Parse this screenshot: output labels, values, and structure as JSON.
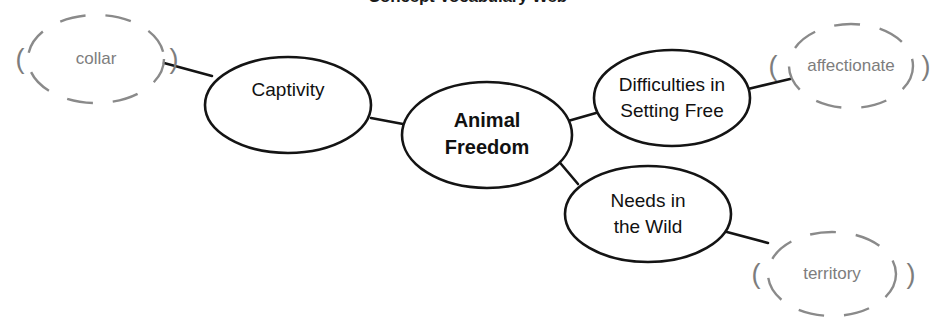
{
  "diagram": {
    "title": "Concept Vocabulary Web",
    "type": "concept-web",
    "colors": {
      "node_stroke": "#141414",
      "node_fill": "#ffffff",
      "vocab_stroke": "#8a8a8a",
      "vocab_text": "#7d7d7d",
      "node_text": "#111111",
      "background": "#ffffff"
    },
    "center_node": {
      "id": "animal-freedom",
      "lines": [
        "Animal",
        "Freedom"
      ],
      "bold": true,
      "cx": 487,
      "cy": 135,
      "rx": 85,
      "ry": 53
    },
    "branch_nodes": [
      {
        "id": "captivity",
        "lines": [
          "Captivity"
        ],
        "cx": 288,
        "cy": 105,
        "rx": 83,
        "ry": 48
      },
      {
        "id": "difficulties-setting-free",
        "lines": [
          "Difficulties in",
          "Setting Free"
        ],
        "cx": 672,
        "cy": 98,
        "rx": 78,
        "ry": 48
      },
      {
        "id": "needs-in-the-wild",
        "lines": [
          "Needs in",
          "the Wild"
        ],
        "cx": 648,
        "cy": 214,
        "rx": 83,
        "ry": 48
      }
    ],
    "vocab_nodes": [
      {
        "id": "collar",
        "label": "collar",
        "open_paren": "(",
        "close_paren": ")",
        "cx": 96,
        "cy": 59,
        "rx": 68,
        "ry": 44,
        "paren_left_x": 20,
        "paren_right_x": 174
      },
      {
        "id": "affectionate",
        "label": "affectionate",
        "open_paren": "(",
        "close_paren": ")",
        "cx": 851,
        "cy": 66,
        "rx": 62,
        "ry": 42,
        "paren_left_x": 773,
        "paren_right_x": 926
      },
      {
        "id": "territory",
        "label": "territory",
        "open_paren": "(",
        "close_paren": ")",
        "cx": 832,
        "cy": 274,
        "rx": 64,
        "ry": 42,
        "paren_left_x": 756,
        "paren_right_x": 911
      }
    ],
    "connectors": [
      {
        "id": "center-to-captivity",
        "from": "animal-freedom",
        "to": "captivity",
        "points": "371,118 403,124"
      },
      {
        "id": "center-to-difficulties",
        "from": "animal-freedom",
        "to": "difficulties-setting-free",
        "points": "568,121 596,113"
      },
      {
        "id": "center-to-needs",
        "from": "animal-freedom",
        "to": "needs-in-the-wild",
        "points": "556,158 578,184"
      },
      {
        "id": "captivity-to-collar",
        "from": "captivity",
        "to": "collar",
        "points": "212,76 164,63"
      },
      {
        "id": "difficulties-to-affectionate",
        "from": "difficulties-setting-free",
        "to": "affectionate",
        "points": "748,89 790,79"
      },
      {
        "id": "needs-to-territory",
        "from": "needs-in-the-wild",
        "to": "territory",
        "points": "712,228 768,243"
      }
    ]
  }
}
